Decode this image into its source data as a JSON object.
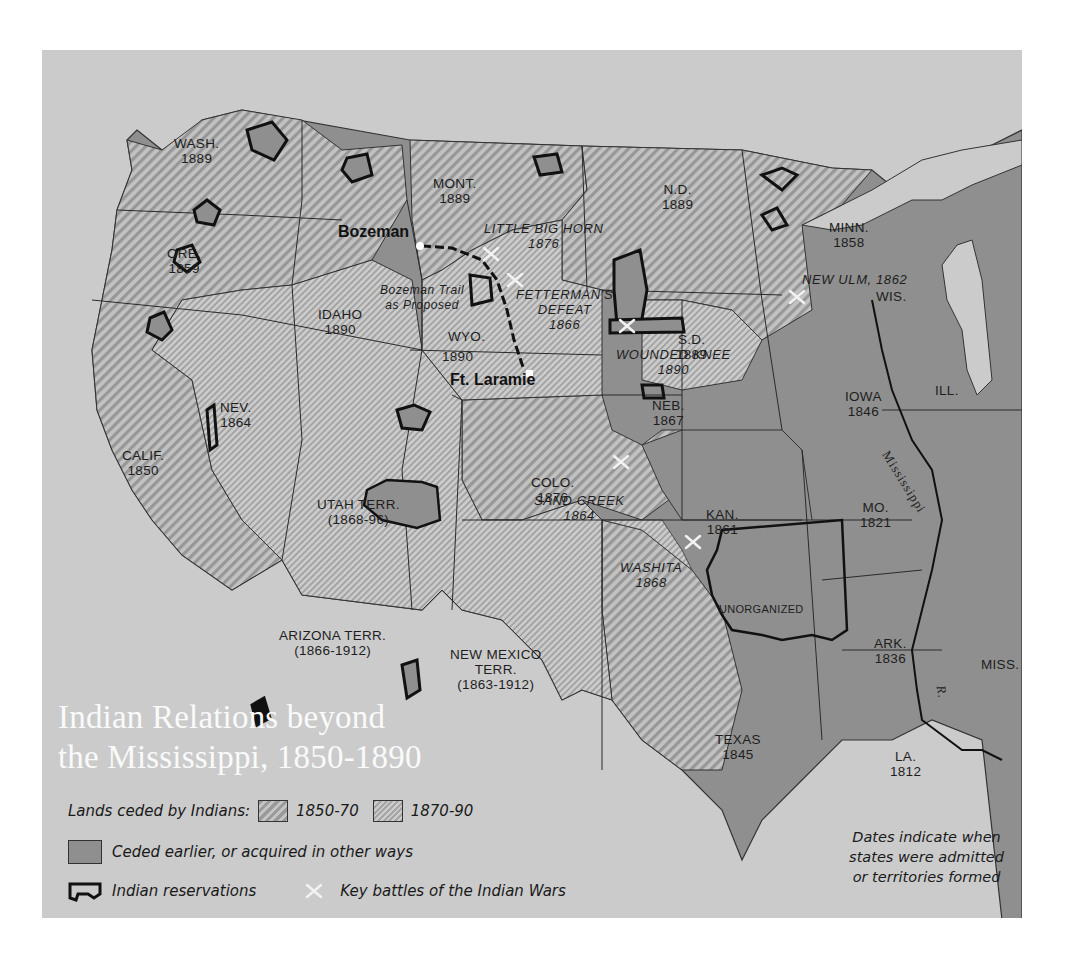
{
  "map": {
    "title_line1": "Indian Relations beyond",
    "title_line2": "the Mississippi, 1850-1890",
    "colors": {
      "ocean": "#cbcbcb",
      "ceded_1850_70_stripe": "#9a9a9a",
      "ceded_1870_90_stripe": "#a6a6a6",
      "ceded_earlier": "#8f8f8f",
      "reservation_outline": "#111111",
      "title": "#fafafa"
    },
    "states": [
      {
        "name": "WASH.",
        "year": "1889"
      },
      {
        "name": "ORE.",
        "year": "1859"
      },
      {
        "name": "CALIF.",
        "year": "1850"
      },
      {
        "name": "NEV.",
        "year": "1864"
      },
      {
        "name": "IDAHO",
        "year": "1890"
      },
      {
        "name": "MONT.",
        "year": "1889"
      },
      {
        "name": "WYO.",
        "year": "1890"
      },
      {
        "name": "UTAH TERR.",
        "year": "(1868-96)"
      },
      {
        "name": "ARIZONA TERR.",
        "year": "(1866-1912)"
      },
      {
        "name": "NEW MEXICO",
        "year": "TERR.",
        "year2": "(1863-1912)"
      },
      {
        "name": "COLO.",
        "year": "1876"
      },
      {
        "name": "N.D.",
        "year": "1889"
      },
      {
        "name": "S.D.",
        "year": "1889"
      },
      {
        "name": "NEB.",
        "year": "1867"
      },
      {
        "name": "KAN.",
        "year": "1861"
      },
      {
        "name": "MINN.",
        "year": "1858"
      },
      {
        "name": "IOWA",
        "year": "1846"
      },
      {
        "name": "MO.",
        "year": "1821"
      },
      {
        "name": "ARK.",
        "year": "1836"
      },
      {
        "name": "LA.",
        "year": "1812"
      },
      {
        "name": "TEXAS",
        "year": "1845"
      },
      {
        "name": "WIS.",
        "year": ""
      },
      {
        "name": "ILL.",
        "year": ""
      },
      {
        "name": "MISS.",
        "year": ""
      },
      {
        "name": "UNORGANIZED",
        "year": ""
      }
    ],
    "battles": [
      {
        "name": "LITTLE BIG HORN",
        "year": "1876"
      },
      {
        "name": "FETTERMAN'S",
        "name2": "DEFEAT",
        "year": "1866"
      },
      {
        "name": "WOUNDED KNEE",
        "year": "1890"
      },
      {
        "name": "SAND CREEK",
        "year": "1864"
      },
      {
        "name": "WASHITA",
        "year": "1868"
      },
      {
        "name": "NEW ULM, 1862",
        "year": ""
      }
    ],
    "places": {
      "bozeman": "Bozeman",
      "ft_laramie": "Ft. Laramie",
      "bozeman_trail_line1": "Bozeman Trail",
      "bozeman_trail_line2": "as Proposed"
    },
    "rivers": {
      "mississippi": "Mississippi",
      "r": "R."
    }
  },
  "legend": {
    "lands_ceded_label": "Lands ceded by Indians:",
    "period_1": "1850-70",
    "period_2": "1870-90",
    "ceded_earlier_label": "Ceded earlier, or acquired in other ways",
    "reservations_label": "Indian reservations",
    "battles_label": "Key battles of the Indian Wars"
  },
  "note": {
    "line1": "Dates indicate when",
    "line2": "states were admitted",
    "line3": "or territories formed"
  }
}
